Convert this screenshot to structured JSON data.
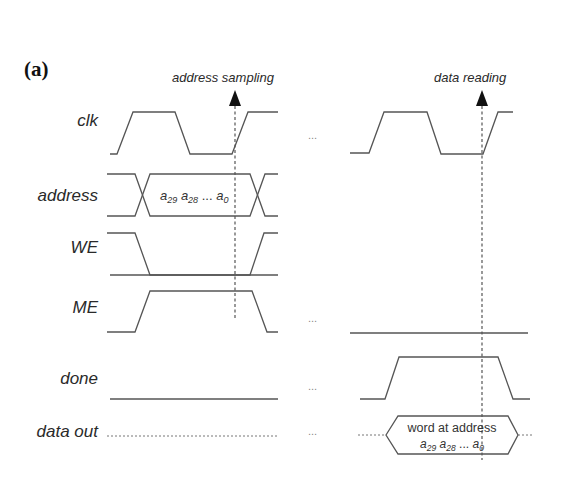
{
  "figure": {
    "panel_label": "(a)",
    "annotations": {
      "left_marker": "address sampling",
      "right_marker": "data reading"
    },
    "signals": [
      {
        "name": "clk"
      },
      {
        "name": "address"
      },
      {
        "name": "WE"
      },
      {
        "name": "ME"
      },
      {
        "name": "done"
      },
      {
        "name": "data out"
      }
    ],
    "address_value": {
      "a29": "a",
      "sub29": "29",
      "a28": "a",
      "sub28": "28",
      "ellipsis": "...",
      "a0": "a",
      "sub0": "0"
    },
    "data_out_value": {
      "line1": "word at address",
      "a29": "a",
      "sub29": "29",
      "a28": "a",
      "sub28": "28",
      "ellipsis": "...",
      "a0": "a",
      "sub0": "0"
    },
    "gap_ellipsis": "..."
  }
}
